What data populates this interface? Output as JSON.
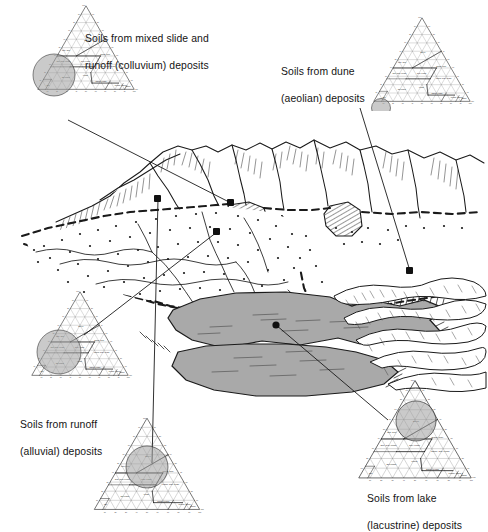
{
  "figure": {
    "type": "landscape-block-diagram-with-soil-texture-triangles",
    "background_color": "#ffffff",
    "ink_color": "#1a1a1a",
    "lake_fill": "#a9a9a9",
    "magnifier_fill": "#9e9e9e"
  },
  "captions": [
    {
      "id": "colluvium",
      "line1": "Soils from mixed slide and",
      "line2": "runoff (colluvium) deposits",
      "x": 85,
      "y": 18,
      "align": "left"
    },
    {
      "id": "aeolian",
      "line1": "Soils from dune",
      "line2": "(aeolian) deposits",
      "x": 281,
      "y": 51,
      "align": "left"
    },
    {
      "id": "alluvial",
      "line1": "Soils from runoff",
      "line2": "(alluvial) deposits",
      "x": 20,
      "y": 404,
      "align": "left"
    },
    {
      "id": "lacustrine",
      "line1": "Soils from lake",
      "line2": "(lacustrine) deposits",
      "x": 367,
      "y": 478,
      "align": "left"
    }
  ],
  "triangles": [
    {
      "id": "colluvium-triangle",
      "x": 32,
      "y": 2,
      "size": 108,
      "highlight": {
        "cx": 22,
        "cy": 73,
        "r": 21,
        "label": "sandy clay loam / loam boundary"
      }
    },
    {
      "id": "aeolian-triangle",
      "x": 368,
      "y": 14,
      "size": 108,
      "highlight": {
        "cx": 13,
        "cy": 94,
        "r": 9.5,
        "label": "sand"
      }
    },
    {
      "id": "alluvial-triangle",
      "x": 26,
      "y": 288,
      "size": 108,
      "highlight": {
        "cx": 33,
        "cy": 64,
        "r": 22,
        "label": "sandy clay loam / clay loam"
      }
    },
    {
      "id": "lacustrine-triangle",
      "x": 352,
      "y": 376,
      "size": 126,
      "highlight": {
        "cx": 64,
        "cy": 45,
        "r": 20,
        "label": "clay loam / clay"
      }
    },
    {
      "id": "alluvial-fan-triangle",
      "x": 88,
      "y": 414,
      "size": 118,
      "highlight": {
        "cx": 59,
        "cy": 53,
        "r": 21,
        "label": "clay loam / loam"
      }
    }
  ],
  "texture_classes": [
    {
      "name": "CLAY",
      "clay": 58,
      "silt": 20,
      "sand": 22,
      "bold": true
    },
    {
      "name": "Silty Clay",
      "clay": 47,
      "silt": 47,
      "sand": 6
    },
    {
      "name": "Sandy Clay",
      "clay": 42,
      "silt": 9,
      "sand": 49
    },
    {
      "name": "Silty Clay Loam",
      "clay": 33,
      "silt": 57,
      "sand": 10
    },
    {
      "name": "Clay Loam",
      "clay": 33,
      "silt": 34,
      "sand": 33
    },
    {
      "name": "Sandy Clay Loam",
      "clay": 27,
      "silt": 14,
      "sand": 59
    },
    {
      "name": "Silt Loam",
      "clay": 14,
      "silt": 64,
      "sand": 22
    },
    {
      "name": "Loam",
      "clay": 17,
      "silt": 42,
      "sand": 41
    },
    {
      "name": "Silt",
      "clay": 5,
      "silt": 87,
      "sand": 8
    },
    {
      "name": "Sandy Loam",
      "clay": 9,
      "silt": 30,
      "sand": 61
    },
    {
      "name": "Loamy Sand",
      "clay": 5,
      "silt": 12,
      "sand": 83
    },
    {
      "name": "Sand",
      "clay": 3,
      "silt": 5,
      "sand": 92
    }
  ],
  "axis_labels": {
    "left": "percent clay",
    "right": "percent silt",
    "bottom": "percent sand",
    "ticks": [
      10,
      20,
      30,
      40,
      50,
      60,
      70,
      80,
      90,
      100
    ]
  },
  "landscape": {
    "features": [
      {
        "id": "mountain-range",
        "label": "mountains with slide slopes"
      },
      {
        "id": "colluvium-apron",
        "label": "hatched colluvium deposit"
      },
      {
        "id": "alluvial-fan",
        "label": "stippled alluvial fan"
      },
      {
        "id": "lake",
        "label": "lake (lacustrine basin)"
      },
      {
        "id": "dune-field",
        "label": "dune field (aeolian)"
      },
      {
        "id": "stream-channels",
        "label": "braided stream channels"
      }
    ],
    "markers": [
      {
        "id": "marker-colluvium",
        "x": 231,
        "y": 203
      },
      {
        "id": "marker-aeolian",
        "x": 410,
        "y": 271
      },
      {
        "id": "marker-alluvial",
        "x": 217,
        "y": 232
      },
      {
        "id": "marker-lake",
        "x": 276,
        "y": 325
      },
      {
        "id": "marker-fan",
        "x": 158,
        "y": 199
      }
    ]
  }
}
